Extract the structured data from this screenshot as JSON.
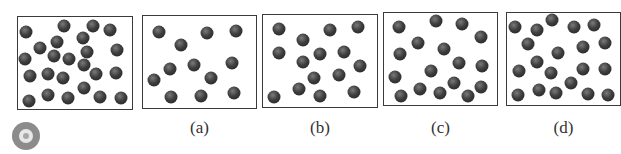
{
  "figure": {
    "panels": [
      {
        "id": "original",
        "label": "",
        "box": {
          "x": 17,
          "y": 16,
          "w": 116,
          "h": 94
        },
        "particles": [
          [
            26,
            32
          ],
          [
            64,
            26
          ],
          [
            93,
            26
          ],
          [
            110,
            30
          ],
          [
            57,
            42
          ],
          [
            83,
            38
          ],
          [
            40,
            48
          ],
          [
            87,
            52
          ],
          [
            117,
            50
          ],
          [
            25,
            59
          ],
          [
            54,
            56
          ],
          [
            69,
            59
          ],
          [
            84,
            65
          ],
          [
            30,
            76
          ],
          [
            48,
            74
          ],
          [
            63,
            78
          ],
          [
            96,
            74
          ],
          [
            116,
            73
          ],
          [
            84,
            88
          ],
          [
            29,
            101
          ],
          [
            48,
            95
          ],
          [
            68,
            98
          ],
          [
            100,
            97
          ],
          [
            121,
            98
          ]
        ]
      },
      {
        "id": "a",
        "label": "(a)",
        "box": {
          "x": 142,
          "y": 15,
          "w": 115,
          "h": 94
        },
        "particles": [
          [
            159,
            32
          ],
          [
            207,
            33
          ],
          [
            236,
            31
          ],
          [
            181,
            45
          ],
          [
            170,
            69
          ],
          [
            194,
            65
          ],
          [
            232,
            63
          ],
          [
            154,
            80
          ],
          [
            211,
            78
          ],
          [
            171,
            97
          ],
          [
            201,
            96
          ],
          [
            234,
            93
          ]
        ]
      },
      {
        "id": "b",
        "label": "(b)",
        "box": {
          "x": 262,
          "y": 14,
          "w": 116,
          "h": 94
        },
        "particles": [
          [
            279,
            29
          ],
          [
            330,
            30
          ],
          [
            358,
            27
          ],
          [
            303,
            40
          ],
          [
            279,
            53
          ],
          [
            320,
            54
          ],
          [
            344,
            52
          ],
          [
            303,
            62
          ],
          [
            360,
            66
          ],
          [
            314,
            78
          ],
          [
            339,
            75
          ],
          [
            299,
            89
          ],
          [
            320,
            96
          ],
          [
            274,
            97
          ],
          [
            354,
            92
          ]
        ]
      },
      {
        "id": "c",
        "label": "(c)",
        "box": {
          "x": 383,
          "y": 12,
          "w": 115,
          "h": 94
        },
        "particles": [
          [
            399,
            27
          ],
          [
            436,
            21
          ],
          [
            462,
            24
          ],
          [
            481,
            37
          ],
          [
            418,
            43
          ],
          [
            444,
            49
          ],
          [
            400,
            54
          ],
          [
            459,
            63
          ],
          [
            482,
            66
          ],
          [
            395,
            77
          ],
          [
            431,
            71
          ],
          [
            454,
            83
          ],
          [
            481,
            87
          ],
          [
            401,
            96
          ],
          [
            420,
            89
          ],
          [
            440,
            93
          ],
          [
            468,
            96
          ]
        ]
      },
      {
        "id": "d",
        "label": "(d)",
        "box": {
          "x": 506,
          "y": 12,
          "w": 115,
          "h": 94
        },
        "particles": [
          [
            515,
            27
          ],
          [
            537,
            30
          ],
          [
            552,
            20
          ],
          [
            574,
            27
          ],
          [
            594,
            25
          ],
          [
            528,
            44
          ],
          [
            558,
            53
          ],
          [
            583,
            47
          ],
          [
            605,
            43
          ],
          [
            537,
            62
          ],
          [
            519,
            71
          ],
          [
            551,
            73
          ],
          [
            583,
            69
          ],
          [
            605,
            69
          ],
          [
            571,
            83
          ],
          [
            518,
            95
          ],
          [
            539,
            90
          ],
          [
            556,
            93
          ],
          [
            588,
            94
          ],
          [
            608,
            95
          ]
        ]
      }
    ],
    "indicator_icon": "disc-icon"
  }
}
